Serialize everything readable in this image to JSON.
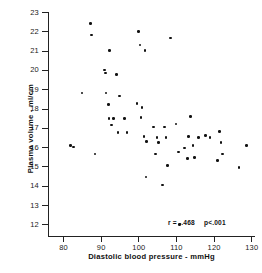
{
  "chart_data": {
    "type": "scatter",
    "title": "",
    "xlabel": "Diastolic blood pressure - mmHg",
    "ylabel": "Plasma volume - ml/cm",
    "xlim": [
      76,
      131
    ],
    "ylim": [
      11.4,
      23
    ],
    "xticks": [
      80,
      90,
      100,
      110,
      120,
      130
    ],
    "xtick_labels": [
      "80",
      "90",
      "100",
      "110",
      "120",
      "130"
    ],
    "yticks": [
      12,
      13,
      14,
      15,
      16,
      17,
      18,
      19,
      20,
      21,
      22,
      23
    ],
    "ytick_labels": [
      "12",
      "13",
      "14",
      "15",
      "16",
      "17",
      "18",
      "19",
      "20",
      "21",
      "22",
      "23"
    ],
    "grid": false,
    "legend": false,
    "marker": "filled-circle",
    "marker_color": "#121212",
    "annotations": {
      "correlation_label": "r = -.468",
      "pvalue_label": "p<.001"
    },
    "x": [
      82.0,
      82.7,
      85.0,
      87.3,
      87.6,
      88.5,
      91.0,
      91.3,
      91.4,
      92.0,
      92.2,
      92.4,
      92.8,
      93.4,
      94.2,
      94.6,
      95.0,
      96.3,
      97.0,
      99.7,
      100.0,
      100.4,
      100.7,
      101.0,
      101.5,
      101.8,
      102.0,
      102.2,
      104.0,
      104.6,
      105.0,
      105.3,
      106.5,
      107.0,
      107.4,
      107.8,
      108.5,
      110.0,
      110.6,
      111.0,
      112.3,
      113.0,
      113.4,
      113.8,
      114.5,
      115.0,
      116.0,
      117.8,
      119.0,
      121.0,
      121.5,
      122.0,
      122.3,
      126.8,
      128.7
    ],
    "y": [
      16.1,
      16.0,
      18.8,
      22.4,
      21.8,
      15.65,
      20.0,
      19.85,
      18.8,
      18.2,
      17.5,
      21.0,
      17.15,
      17.5,
      19.75,
      16.75,
      18.65,
      17.5,
      16.75,
      18.25,
      22.0,
      21.3,
      17.55,
      18.05,
      16.55,
      21.0,
      14.45,
      16.3,
      17.05,
      15.65,
      16.5,
      16.25,
      14.05,
      17.05,
      16.5,
      15.05,
      21.65,
      17.2,
      15.75,
      12.0,
      15.95,
      15.4,
      16.55,
      17.6,
      16.1,
      15.45,
      16.5,
      16.6,
      16.5,
      15.3,
      16.8,
      16.25,
      15.65,
      14.95,
      16.1
    ]
  },
  "axes": {
    "x_title": "Diastolic blood pressure - mmHg",
    "y_title": "Plasma volume - ml/cm"
  },
  "stats": {
    "r_text": "r = -.468",
    "p_text": "p<.001"
  }
}
